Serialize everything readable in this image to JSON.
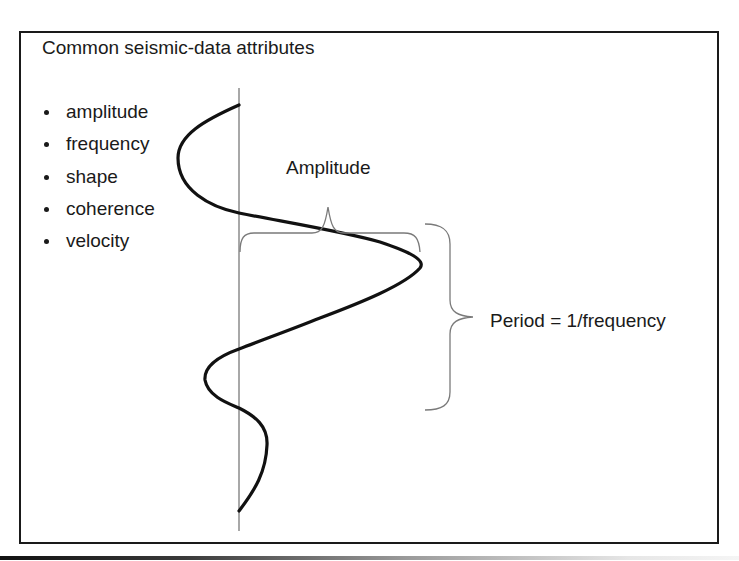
{
  "slide": {
    "title": "Common seismic-data attributes",
    "bullets": [
      {
        "label": "amplitude"
      },
      {
        "label": "frequency"
      },
      {
        "label": "shape"
      },
      {
        "label": "coherence"
      },
      {
        "label": "velocity"
      }
    ]
  },
  "diagram": {
    "amplitude_label": "Amplitude",
    "period_label": "Period = 1/frequency",
    "colors": {
      "wave": "#111111",
      "axis": "#6e6e6e",
      "brace": "#7a7a7a",
      "frame": "#1a1a1a",
      "text": "#1a1a1a"
    }
  }
}
